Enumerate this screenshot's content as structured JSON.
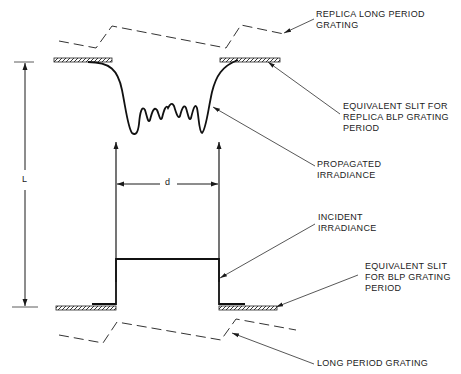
{
  "diagram": {
    "labels": {
      "replica_long_period_grating": "REPLICA LONG PERIOD\nGRATING",
      "equivalent_slit_replica": "EQUIVALENT SLIT FOR\nREPLICA BLP GRATING\nPERIOD",
      "propagated_irradiance": "PROPAGATED\nIRRADIANCE",
      "incident_irradiance": "INCIDENT\nIRRADIANCE",
      "equivalent_slit_blp": "EQUIVALENT SLIT\nFOR BLP GRATING\nPERIOD",
      "long_period_grating": "LONG PERIOD GRATING"
    },
    "dimensions": {
      "length_symbol": "L",
      "width_symbol": "d"
    },
    "colors": {
      "line": "#1a1a1a",
      "leader": "#444444",
      "background": "#ffffff"
    }
  }
}
